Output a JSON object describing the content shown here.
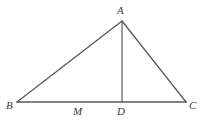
{
  "figure": {
    "kind": "geometry-diagram",
    "background_color": "#ffffff",
    "stroke_color": "#5a5a5a",
    "label_color": "#3a3a3a",
    "labels": {
      "apex": "A",
      "base_left": "B",
      "base_right": "C",
      "foot_of_altitude": "D",
      "midpoint_mark": "M"
    },
    "points": {
      "A": {
        "x": 122,
        "y": 21
      },
      "B": {
        "x": 17,
        "y": 102
      },
      "C": {
        "x": 186,
        "y": 102
      },
      "D": {
        "x": 122,
        "y": 102
      },
      "M": {
        "x": 78,
        "y": 102
      }
    },
    "segments": [
      {
        "name": "AB",
        "from": "A",
        "to": "B"
      },
      {
        "name": "BC",
        "from": "B",
        "to": "C"
      },
      {
        "name": "AC",
        "from": "A",
        "to": "C"
      },
      {
        "name": "AD",
        "from": "A",
        "to": "D"
      }
    ]
  }
}
